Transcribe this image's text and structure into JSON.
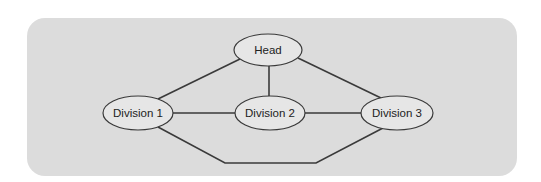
{
  "diagram": {
    "type": "org-network",
    "colors": {
      "background": "#ffffff",
      "panel": "#dcdcdc",
      "node_fill": "#e6e6e6",
      "stroke": "#3a3a3a",
      "text": "#222222"
    },
    "nodes": [
      {
        "id": "head",
        "label": "Head",
        "cx": 268,
        "cy": 50,
        "rx": 34,
        "ry": 16
      },
      {
        "id": "div1",
        "label": "Division 1",
        "cx": 138,
        "cy": 113,
        "rx": 35,
        "ry": 17
      },
      {
        "id": "div2",
        "label": "Division 2",
        "cx": 270,
        "cy": 113,
        "rx": 35,
        "ry": 17
      },
      {
        "id": "div3",
        "label": "Division 3",
        "cx": 397,
        "cy": 113,
        "rx": 36,
        "ry": 17
      }
    ],
    "edges": [
      {
        "from": "head",
        "to": "div1"
      },
      {
        "from": "head",
        "to": "div2"
      },
      {
        "from": "head",
        "to": "div3"
      },
      {
        "from": "div1",
        "to": "div2"
      },
      {
        "from": "div2",
        "to": "div3"
      },
      {
        "from": "div1",
        "to": "div3",
        "routing": "bottom"
      }
    ]
  }
}
